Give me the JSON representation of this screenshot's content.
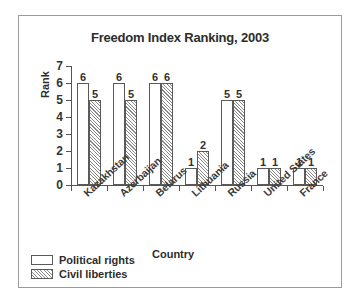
{
  "chart_data": {
    "type": "bar",
    "title": "Freedom Index Ranking, 2003",
    "xlabel": "Country",
    "ylabel": "Rank",
    "categories": [
      "Kazakhstan",
      "Azerbaijan",
      "Belarus",
      "Lithuania",
      "Russia",
      "United States",
      "France"
    ],
    "series": [
      {
        "name": "Political rights",
        "values": [
          6,
          6,
          6,
          1,
          5,
          1,
          1
        ],
        "fill": "solid-outline",
        "color": "#ffffff"
      },
      {
        "name": "Civil liberties",
        "values": [
          5,
          5,
          6,
          2,
          5,
          1,
          1
        ],
        "fill": "diagonal-hatch",
        "color": "#8a8a8a"
      }
    ],
    "ylim": [
      0,
      7
    ],
    "yticks": [
      0,
      1,
      2,
      3,
      4,
      5,
      6,
      7
    ],
    "grid": false,
    "legend_position": "bottom-left",
    "show_data_labels": true
  },
  "style": {
    "border_color": "#9b9b9b",
    "axis_color": "#555555",
    "text_color": "#2d2d2d",
    "bar_outline": "#5a5a5a",
    "background": "#ffffff"
  }
}
